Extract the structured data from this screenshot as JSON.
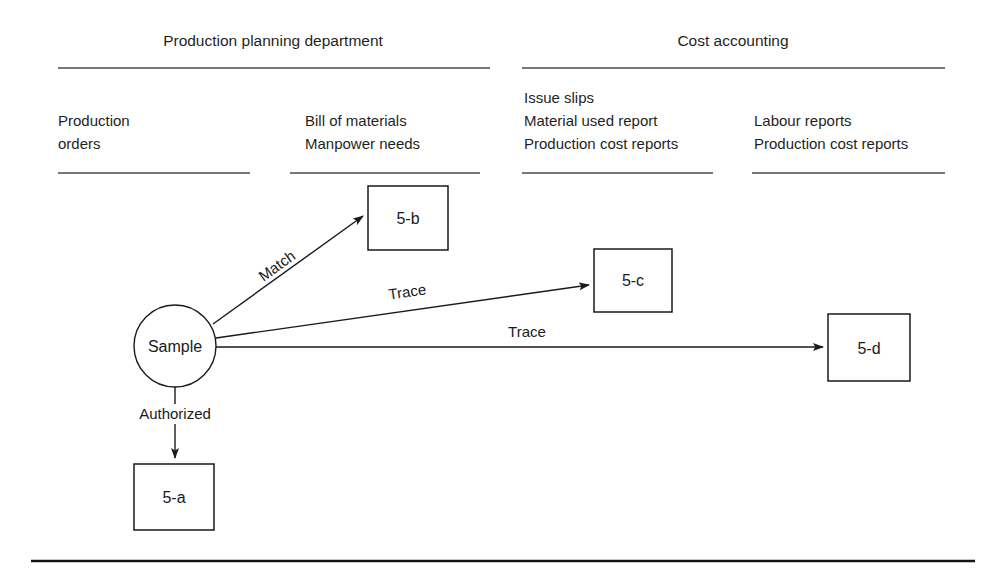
{
  "page": {
    "width": 1001,
    "height": 585,
    "background": "#ffffff",
    "ink": "#1a1a1a"
  },
  "departments": [
    {
      "id": "production-planning",
      "title": "Production planning department"
    },
    {
      "id": "cost-accounting",
      "title": "Cost accounting"
    }
  ],
  "columns": [
    {
      "id": "production-orders",
      "lines": [
        "Production",
        "orders"
      ]
    },
    {
      "id": "bill-of-materials",
      "lines": [
        "Bill of materials",
        "Manpower needs"
      ]
    },
    {
      "id": "issue-slips",
      "lines": [
        "Issue slips",
        "Material used report",
        "Production cost reports"
      ]
    },
    {
      "id": "labour-reports",
      "lines": [
        "Labour reports",
        "Production cost reports"
      ]
    }
  ],
  "nodes": [
    {
      "id": "sample",
      "label": "Sample",
      "shape": "circle"
    },
    {
      "id": "box-5a",
      "label": "5-a",
      "shape": "rect"
    },
    {
      "id": "box-5b",
      "label": "5-b",
      "shape": "rect"
    },
    {
      "id": "box-5c",
      "label": "5-c",
      "shape": "rect"
    },
    {
      "id": "box-5d",
      "label": "5-d",
      "shape": "rect"
    }
  ],
  "edges": [
    {
      "id": "sample-to-5b",
      "from": "sample",
      "to": "box-5b",
      "label": "Match"
    },
    {
      "id": "sample-to-5c",
      "from": "sample",
      "to": "box-5c",
      "label": "Trace"
    },
    {
      "id": "sample-to-5d",
      "from": "sample",
      "to": "box-5d",
      "label": "Trace"
    },
    {
      "id": "sample-to-5a",
      "from": "sample",
      "to": "box-5a",
      "label": "Authorized"
    }
  ]
}
